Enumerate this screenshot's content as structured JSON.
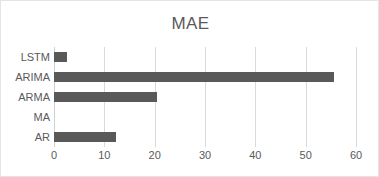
{
  "chart_data": {
    "type": "bar",
    "orientation": "horizontal",
    "title": "MAE",
    "xlabel": "",
    "ylabel": "",
    "categories": [
      "AR",
      "MA",
      "ARMA",
      "ARIMA",
      "LSTM"
    ],
    "values": [
      12.3,
      0,
      20.4,
      55.6,
      2.6
    ],
    "xlim": [
      0,
      60
    ],
    "xticks": [
      0,
      10,
      20,
      30,
      40,
      50,
      60
    ],
    "xtick_labels": [
      "0",
      "10",
      "20",
      "30",
      "40",
      "50",
      "60"
    ],
    "grid": "vertical",
    "legend": null,
    "series": [
      {
        "name": "MAE",
        "color": "#595959",
        "values": [
          12.3,
          0,
          20.4,
          55.6,
          2.6
        ]
      }
    ]
  },
  "chart": {
    "title": "MAE",
    "bar_color": "#595959",
    "grid_color": "#d9d9d9",
    "text_color": "#5a5a5a",
    "border_color": "#e4e4e4"
  }
}
